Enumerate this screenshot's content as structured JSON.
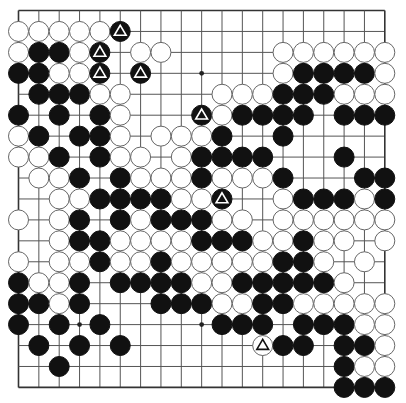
{
  "board": {
    "size": 19,
    "origin_x": 18.5,
    "origin_y": 10.5,
    "step_x": 20.35,
    "step_y": 20.94,
    "stone_radius": 10,
    "legend": {
      "B": "black stone",
      "W": "white stone",
      "b": "black stone with triangle mark",
      "w": "white stone with triangle mark",
      ".": "empty"
    },
    "star_points": [
      [
        3,
        3
      ],
      [
        9,
        3
      ],
      [
        15,
        3
      ],
      [
        3,
        9
      ],
      [
        9,
        9
      ],
      [
        15,
        9
      ],
      [
        3,
        15
      ],
      [
        9,
        15
      ],
      [
        15,
        15
      ]
    ],
    "rows": [
      "...................",
      "WWWWWb.............",
      "WBBWb.WW.....WWWWWW",
      "BBWWb.b......WBBBBW",
      ".BBBWW....WWWBBBWWW",
      "B.B.BW...bWBBBB.BBB",
      "WB.BBW.WWWB..B.....",
      "WWB.BWW.WBBBB...B..",
      ".WWB.BWWWBWWWB...BB",
      "..WWBBBBWWb..WBBBWB",
      "W.WB.BWBBBWW.WWWWWW",
      "..WBBWWWWBBBWWBWW.W",
      "W.WWBWWBWWWWWBBW.W.",
      "BWWB.BBBBWWBBBBBW..",
      "BBWB...BBBWWBBWWWWW",
      "B.B.B.....BBB.BBBWW",
      ".B.B.B......wBB.BBW",
      "..B.............BWW",
      "................BBB"
    ],
    "colors": {
      "black_stone": "#111111",
      "white_stone": "#ffffff",
      "grid": "#555555",
      "background": "#ffffff"
    }
  }
}
